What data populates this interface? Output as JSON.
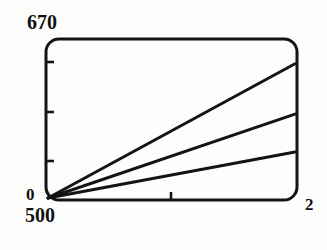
{
  "figure": {
    "panel_label": ")",
    "background_color": "#fdfdfc",
    "ink_color": "#141414"
  },
  "axes": {
    "y_max_label": "670",
    "y_min_label": "0",
    "x_min_label": "500",
    "x_max_label": "2",
    "y_tick_count": 3,
    "x_tick_count": 1
  },
  "chart_data": {
    "type": "line",
    "title": "",
    "subtitle": "",
    "xlabel": "",
    "ylabel": "",
    "xlim": [
      500,
      2
    ],
    "ylim": [
      0,
      670
    ],
    "x_tick_labels": [
      "500",
      "2"
    ],
    "y_tick_labels": [
      "0",
      "670"
    ],
    "x_interior_ticks": [
      251
    ],
    "y_interior_ticks": [
      167.5,
      335,
      502.5
    ],
    "grid": false,
    "legend": false,
    "legend_position": "none",
    "annotations": [],
    "series": [
      {
        "name": "line-1",
        "x": [
          500,
          2
        ],
        "values": [
          0,
          608
        ],
        "style": "solid"
      },
      {
        "name": "line-2",
        "x": [
          500,
          2
        ],
        "values": [
          0,
          380
        ],
        "style": "solid"
      },
      {
        "name": "line-3",
        "x": [
          500,
          2
        ],
        "values": [
          0,
          208
        ],
        "style": "solid"
      }
    ]
  }
}
